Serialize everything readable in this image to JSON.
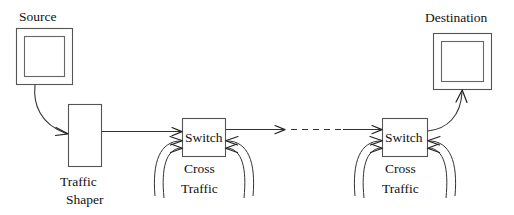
{
  "diagram": {
    "background_color": "#ffffff",
    "stroke_color": "#333333",
    "nodes": {
      "source": {
        "label": "Source",
        "shape": "double-rectangle",
        "x": 16,
        "y": 28,
        "width": 57,
        "height": 57
      },
      "destination": {
        "label": "Destination",
        "shape": "double-rectangle",
        "x": 433,
        "y": 33,
        "width": 59,
        "height": 57
      },
      "traffic_shaper": {
        "label_line1": "Traffic",
        "label_line2": "Shaper",
        "shape": "rectangle",
        "x": 68,
        "y": 104,
        "width": 34,
        "height": 63
      },
      "switch1": {
        "label": "Switch",
        "cross_traffic_line1": "Cross",
        "cross_traffic_line2": "Traffic",
        "shape": "rectangle",
        "x": 182,
        "y": 118,
        "width": 44,
        "height": 39
      },
      "switch2": {
        "label": "Switch",
        "cross_traffic_line1": "Cross",
        "cross_traffic_line2": "Traffic",
        "shape": "rectangle",
        "x": 382,
        "y": 118,
        "width": 46,
        "height": 39
      }
    },
    "links": [
      {
        "name": "source-to-shaper",
        "style": "curved-arrow",
        "from": "source",
        "to": "traffic_shaper"
      },
      {
        "name": "shaper-to-switch1",
        "style": "straight-arrow",
        "from": "traffic_shaper",
        "to": "switch1"
      },
      {
        "name": "switch1-to-switch2",
        "style": "dashed-arrow",
        "from": "switch1",
        "to": "switch2"
      },
      {
        "name": "switch2-to-destination",
        "style": "curved-arrow",
        "from": "switch2",
        "to": "destination"
      }
    ],
    "cross_traffic_arcs": {
      "count_per_switch": 4,
      "description": "two inbound arcs on each side of each switch"
    }
  }
}
